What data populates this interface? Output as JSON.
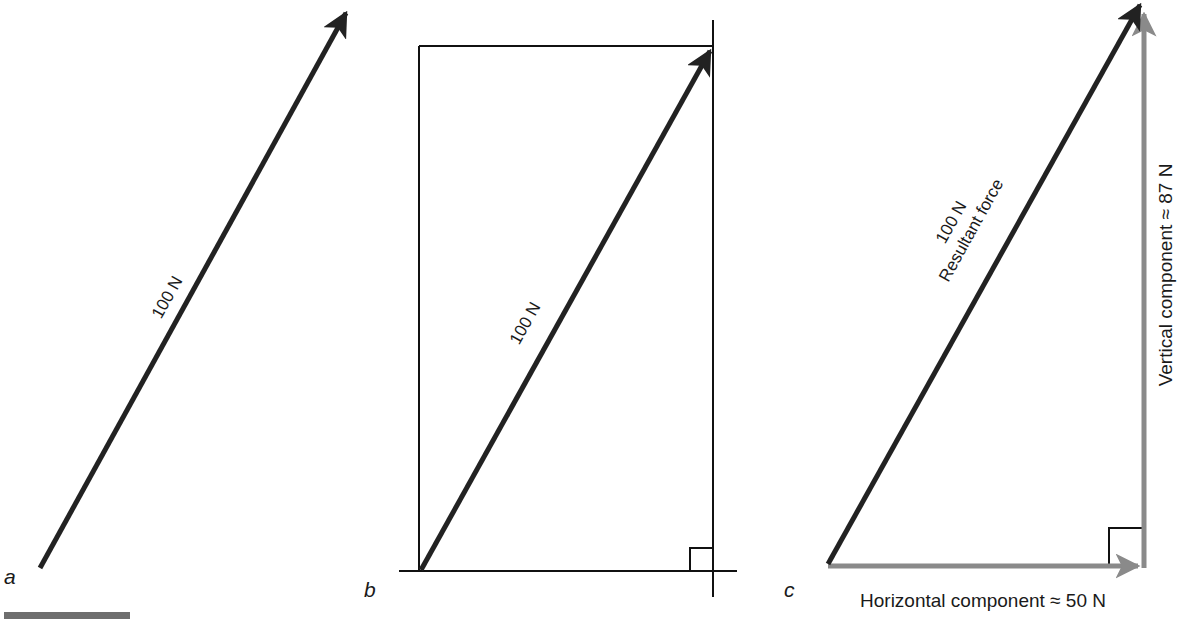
{
  "figure": {
    "colors": {
      "resultant": "#222222",
      "component": "#8a8a8a",
      "construction": "#111111",
      "text": "#1a1a1a",
      "scale_bar": "#6e6e6e"
    },
    "panels": [
      {
        "id": "a",
        "letter": "a",
        "vector_label": "100 N"
      },
      {
        "id": "b",
        "letter": "b",
        "vector_label": "100 N"
      },
      {
        "id": "c",
        "letter": "c",
        "vector_label_line1": "100 N",
        "vector_label_line2": "Resultant force",
        "horizontal_label": "Horizontal component ≈ 50 N",
        "vertical_label": "Vertical component ≈ 87 N"
      }
    ]
  }
}
